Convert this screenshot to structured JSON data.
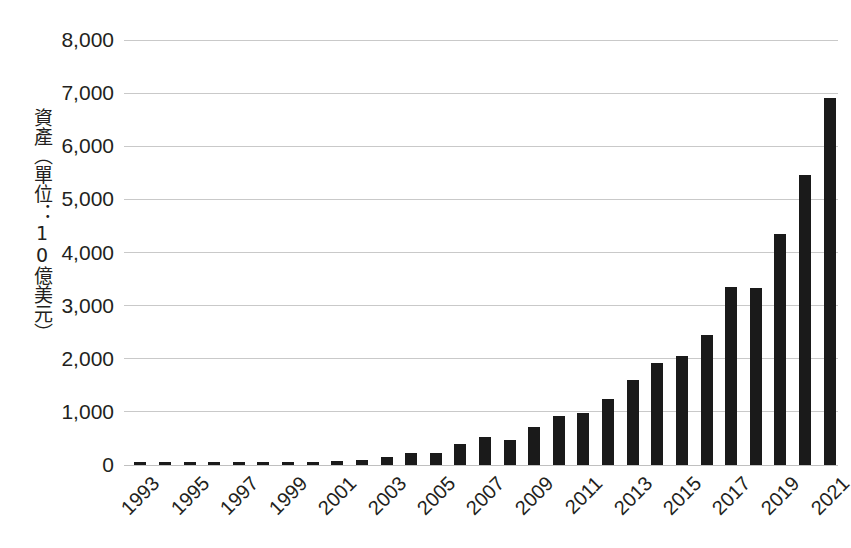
{
  "chart_data": {
    "type": "bar",
    "title": "",
    "subtitle": "",
    "xlabel": "",
    "ylabel": "資產（單位：10億美元）",
    "ylim": [
      0,
      8000
    ],
    "ytick_step": 1000,
    "ytick_labels": [
      "8,000",
      "7,000",
      "6,000",
      "5,000",
      "4,000",
      "3,000",
      "2,000",
      "1,000",
      "0"
    ],
    "ytick_values": [
      8000,
      7000,
      6000,
      5000,
      4000,
      3000,
      2000,
      1000,
      0
    ],
    "grid": true,
    "legend": false,
    "legend_position": "none",
    "bar_color": "#1a1a1a",
    "gridline_color": "#c9c9c9",
    "background_color": "#ffffff",
    "x_label_rotation": -45,
    "x_label_interval": 2,
    "categories": [
      "1993",
      "1994",
      "1995",
      "1996",
      "1997",
      "1998",
      "1999",
      "2000",
      "2001",
      "2002",
      "2003",
      "2004",
      "2005",
      "2006",
      "2007",
      "2008",
      "2009",
      "2010",
      "2011",
      "2012",
      "2013",
      "2014",
      "2015",
      "2016",
      "2017",
      "2018",
      "2019",
      "2020",
      "2021"
    ],
    "visible_tick_labels": [
      "1993",
      "1995",
      "1997",
      "1999",
      "2001",
      "2003",
      "2005",
      "2007",
      "2009",
      "2011",
      "2013",
      "2015",
      "2017",
      "2019",
      "2021"
    ],
    "values": [
      10,
      15,
      20,
      25,
      30,
      35,
      40,
      50,
      70,
      100,
      150,
      220,
      230,
      400,
      520,
      480,
      720,
      920,
      970,
      1250,
      1600,
      1920,
      2050,
      2440,
      3350,
      3340,
      4350,
      5450,
      6900
    ],
    "series": [
      {
        "name": "資產",
        "values": [
          10,
          15,
          20,
          25,
          30,
          35,
          40,
          50,
          70,
          100,
          150,
          220,
          230,
          400,
          520,
          480,
          720,
          920,
          970,
          1250,
          1600,
          1920,
          2050,
          2440,
          3350,
          3340,
          4350,
          5450,
          6900
        ]
      }
    ]
  }
}
